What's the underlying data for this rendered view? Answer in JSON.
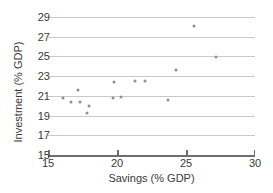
{
  "chart_data": {
    "type": "scatter",
    "title": "",
    "xlabel": "Savings (% GDP)",
    "ylabel": "Investment (% GDP)",
    "xlim": [
      15,
      30
    ],
    "ylim": [
      15,
      29
    ],
    "xticks": [
      15,
      20,
      25,
      30
    ],
    "yticks": [
      15,
      17,
      19,
      21,
      23,
      25,
      27,
      29
    ],
    "xtick_labels": [
      "15",
      "20",
      "25",
      "30"
    ],
    "ytick_labels": [
      "15",
      "17",
      "19",
      "21",
      "23",
      "25",
      "27",
      "29"
    ],
    "grid": "horizontal",
    "legend": "none",
    "marker_color": "#8f8f8f",
    "axis_color": "#6e6e6e",
    "grid_color": "#c9c9c9",
    "points": [
      {
        "x": 16.1,
        "y": 20.8
      },
      {
        "x": 16.7,
        "y": 20.4
      },
      {
        "x": 17.2,
        "y": 21.6
      },
      {
        "x": 17.3,
        "y": 20.4
      },
      {
        "x": 17.8,
        "y": 19.3
      },
      {
        "x": 18.0,
        "y": 20.0
      },
      {
        "x": 19.7,
        "y": 20.8
      },
      {
        "x": 19.8,
        "y": 22.4
      },
      {
        "x": 20.3,
        "y": 20.9
      },
      {
        "x": 21.3,
        "y": 22.5
      },
      {
        "x": 22.0,
        "y": 22.5
      },
      {
        "x": 23.7,
        "y": 20.6
      },
      {
        "x": 24.3,
        "y": 23.6
      },
      {
        "x": 25.6,
        "y": 28.1
      },
      {
        "x": 27.2,
        "y": 24.9
      }
    ]
  }
}
